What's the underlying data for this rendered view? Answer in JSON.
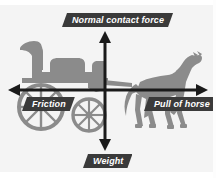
{
  "diagram": {
    "type": "free-body-force-diagram",
    "background_color": "#f4f4f4",
    "silhouette_color": "#8b8b8b",
    "arrow_color": "#1a1a1a",
    "banner_color": "#3a3a3a",
    "banner_text_color": "#ffffff",
    "forces": [
      {
        "id": "normal",
        "label": "Normal contact force",
        "direction": "up",
        "position": "top"
      },
      {
        "id": "friction",
        "label": "Friction",
        "direction": "left",
        "position": "left"
      },
      {
        "id": "pull",
        "label": "Pull of horse",
        "direction": "right",
        "position": "right"
      },
      {
        "id": "weight",
        "label": "Weight",
        "direction": "down",
        "position": "bottom"
      }
    ],
    "axes": {
      "vertical_arrow": "double-headed-vertical-arrow",
      "horizontal_arrow": "double-headed-horizontal-arrow",
      "origin_x": 105,
      "origin_y": 90
    },
    "objects": [
      {
        "id": "carriage",
        "name": "carriage-silhouette"
      },
      {
        "id": "horse",
        "name": "horse-silhouette"
      }
    ]
  }
}
